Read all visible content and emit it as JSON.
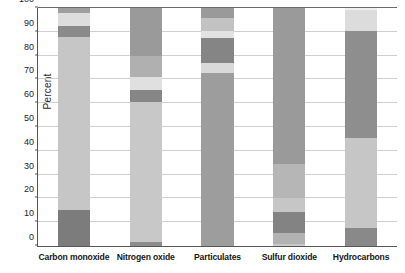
{
  "chart_data": {
    "type": "bar",
    "subtype": "stacked-100-percent",
    "title": "",
    "xlabel": "",
    "ylabel": "Percent",
    "ylim": [
      0,
      100
    ],
    "yticks": [
      0,
      10,
      20,
      30,
      40,
      50,
      60,
      70,
      80,
      90,
      100
    ],
    "ytick_labels": [
      "0",
      "10",
      "20",
      "30",
      "40",
      "50",
      "60",
      "70",
      "80",
      "90",
      "100"
    ],
    "grid": true,
    "legend": "none",
    "categories": [
      "Carbon monoxide",
      "Nitrogen oxide",
      "Particulates",
      "Sulfur dioxide",
      "Hydrocarbons"
    ],
    "colors": {
      "dark": "#7a7a7a",
      "medium": "#9c9c9c",
      "light": "#c4c4c4",
      "pale": "#dcdcdc",
      "white": "#f2f2f2"
    },
    "bars": [
      {
        "category": "Carbon monoxide",
        "segments": [
          {
            "from": 0,
            "to": 15,
            "value": 15,
            "color": "#7c7c7c"
          },
          {
            "from": 15,
            "to": 88,
            "value": 73,
            "color": "#c6c6c6"
          },
          {
            "from": 88,
            "to": 92.5,
            "value": 4.5,
            "color": "#8a8a8a"
          },
          {
            "from": 92.5,
            "to": 98,
            "value": 5.5,
            "color": "#dddddd"
          },
          {
            "from": 98,
            "to": 100,
            "value": 2,
            "color": "#9e9e9e"
          }
        ]
      },
      {
        "category": "Nitrogen oxide",
        "segments": [
          {
            "from": 0,
            "to": 1.5,
            "value": 1.5,
            "color": "#8c8c8c"
          },
          {
            "from": 1.5,
            "to": 60.5,
            "value": 59,
            "color": "#c8c8c8"
          },
          {
            "from": 60.5,
            "to": 65.5,
            "value": 5,
            "color": "#868686"
          },
          {
            "from": 65.5,
            "to": 71,
            "value": 5.5,
            "color": "#e0e0e0"
          },
          {
            "from": 71,
            "to": 80,
            "value": 9,
            "color": "#b0b0b0"
          },
          {
            "from": 80,
            "to": 100,
            "value": 20,
            "color": "#9a9a9a"
          }
        ]
      },
      {
        "category": "Particulates",
        "segments": [
          {
            "from": 0,
            "to": 72.5,
            "value": 72.5,
            "color": "#9d9d9d"
          },
          {
            "from": 72.5,
            "to": 77,
            "value": 4.5,
            "color": "#d9d9d9"
          },
          {
            "from": 77,
            "to": 87.5,
            "value": 10.5,
            "color": "#858585"
          },
          {
            "from": 87.5,
            "to": 90.5,
            "value": 3,
            "color": "#e2e2e2"
          },
          {
            "from": 90.5,
            "to": 96,
            "value": 5.5,
            "color": "#c2c2c2"
          },
          {
            "from": 96,
            "to": 100,
            "value": 4,
            "color": "#9a9a9a"
          }
        ]
      },
      {
        "category": "Sulfur dioxide",
        "segments": [
          {
            "from": 0,
            "to": 0.8,
            "value": 0.8,
            "color": "#c9c9c9"
          },
          {
            "from": 0.8,
            "to": 5.5,
            "value": 4.7,
            "color": "#b2b2b2"
          },
          {
            "from": 5.5,
            "to": 14.5,
            "value": 9,
            "color": "#838383"
          },
          {
            "from": 14.5,
            "to": 20,
            "value": 5.5,
            "color": "#c6c6c6"
          },
          {
            "from": 20,
            "to": 34.5,
            "value": 14.5,
            "color": "#b6b6b6"
          },
          {
            "from": 34.5,
            "to": 100,
            "value": 65.5,
            "color": "#9a9a9a"
          }
        ]
      },
      {
        "category": "Hydrocarbons",
        "segments": [
          {
            "from": 0,
            "to": 7.5,
            "value": 7.5,
            "color": "#898989"
          },
          {
            "from": 7.5,
            "to": 45.5,
            "value": 38,
            "color": "#c6c6c6"
          },
          {
            "from": 45.5,
            "to": 90.5,
            "value": 45,
            "color": "#8e8e8e"
          },
          {
            "from": 90.5,
            "to": 99,
            "value": 8.5,
            "color": "#dcdcdc"
          },
          {
            "from": 99,
            "to": 100,
            "value": 1,
            "color": "#efefef"
          }
        ]
      }
    ]
  }
}
